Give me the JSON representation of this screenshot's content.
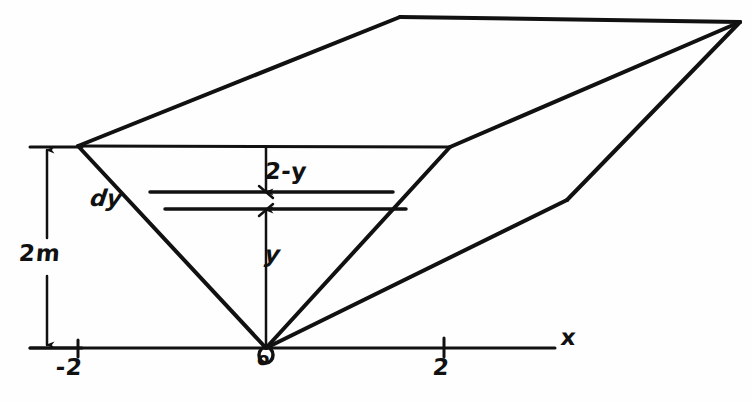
{
  "figure": {
    "background_color": "#fefefe",
    "ink_color": "#111111"
  },
  "labels": {
    "height_dimension": "2m",
    "depth_from_top": "2-y",
    "strip_thickness": "dy",
    "height_variable": "y",
    "x_axis": "x",
    "origin": "o",
    "tick_left": "-2",
    "tick_right": "2"
  },
  "axis": {
    "name": "x-axis",
    "y_position": 348,
    "x_start": 30,
    "x_end": 555,
    "ticks": [
      {
        "label": "-2",
        "x": 78
      },
      {
        "label": "2",
        "x": 444
      }
    ]
  },
  "geometry": {
    "front_face": {
      "name": "front-trapezoid",
      "vertices": [
        {
          "x": 78,
          "y": 146
        },
        {
          "x": 450,
          "y": 147
        },
        {
          "x": 266,
          "y": 348
        }
      ]
    },
    "top_face": {
      "name": "top-face-parallelogram",
      "vertices": [
        {
          "x": 78,
          "y": 146
        },
        {
          "x": 400,
          "y": 17
        },
        {
          "x": 740,
          "y": 22
        },
        {
          "x": 450,
          "y": 147
        }
      ]
    },
    "right_face": {
      "name": "right-side-face",
      "vertices": [
        {
          "x": 450,
          "y": 147
        },
        {
          "x": 740,
          "y": 22
        },
        {
          "x": 567,
          "y": 200
        }
      ]
    },
    "bottom_edge": {
      "name": "bottom-receding-edge",
      "from": {
        "x": 266,
        "y": 348
      },
      "to": {
        "x": 567,
        "y": 200
      }
    },
    "strip": {
      "name": "differential-strip",
      "top_line_y": 193,
      "bottom_line_y": 209,
      "top_left_x": 156,
      "top_right_x": 390,
      "bottom_left_x": 170,
      "bottom_right_x": 404
    },
    "height_dimension_line": {
      "name": "height-dimension",
      "x": 47,
      "top_y": 147,
      "bottom_y": 348,
      "gap_top": 236,
      "gap_bottom": 276,
      "tick_top_x1": 30,
      "tick_top_x2": 82,
      "tick_bottom_x1": 30,
      "tick_bottom_x2": 82
    },
    "vertical_center_line": {
      "name": "center-measure-line",
      "x": 266,
      "top_y": 146,
      "bottom_y": 348,
      "strip_top_y": 193,
      "strip_bottom_y": 209
    }
  }
}
